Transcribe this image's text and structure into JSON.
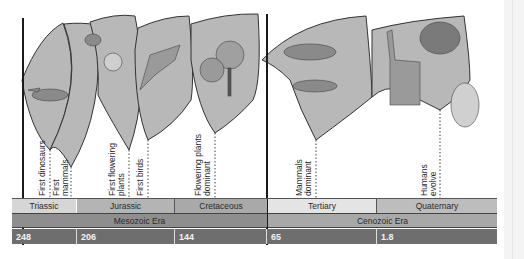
{
  "diagram": {
    "colors": {
      "fan_fill": "#b8b8b8",
      "fan_stroke": "#333333",
      "period_light": "#d6d6d6",
      "period_mid": "#a9a9a9",
      "era_row": "#8e8e8e",
      "era_row_cenozoic": "#a8a8a8",
      "date_row": "#6e6e6e"
    },
    "events": [
      {
        "label_lines": [
          "First dinosaurs"
        ],
        "x": 50
      },
      {
        "label_lines": [
          "First",
          "mammals"
        ],
        "x": 71
      },
      {
        "label_lines": [
          "First flowering",
          "plants"
        ],
        "x": 129
      },
      {
        "label_lines": [
          "First birds"
        ],
        "x": 148
      },
      {
        "label_lines": [
          "Flowering plants",
          "dominant"
        ],
        "x": 215
      },
      {
        "label_lines": [
          "Mammals",
          "dominant"
        ],
        "x": 316
      },
      {
        "label_lines": [
          "Humans",
          "evolve"
        ],
        "x": 440
      }
    ],
    "periods": [
      {
        "name": "Triassic",
        "x": 12,
        "w": 65,
        "shade": "light"
      },
      {
        "name": "Jurassic",
        "x": 77,
        "w": 98,
        "shade": "mid"
      },
      {
        "name": "Cretaceous",
        "x": 175,
        "w": 92,
        "shade": "mid"
      },
      {
        "name": "Tertiary",
        "x": 267,
        "w": 110,
        "shade": "light"
      },
      {
        "name": "Quaternary",
        "x": 377,
        "w": 120,
        "shade": "mid"
      }
    ],
    "eras": [
      {
        "name": "Mesozoic Era",
        "x": 12,
        "w": 255
      },
      {
        "name": "Cenozoic Era",
        "x": 267,
        "w": 230
      }
    ],
    "dates": [
      {
        "value": "248",
        "x": 12,
        "w": 65
      },
      {
        "value": "206",
        "x": 77,
        "w": 98
      },
      {
        "value": "144",
        "x": 175,
        "w": 92
      },
      {
        "value": "65",
        "x": 267,
        "w": 110
      },
      {
        "value": "1.8",
        "x": 377,
        "w": 120
      }
    ],
    "illustrations": [
      "dinosaur-illustration",
      "early-mammal-illustration",
      "flowering-plant-illustration",
      "bird-illustration",
      "trees-illustration",
      "tertiary-mammals-illustration",
      "mammoth-illustration",
      "llama-illustration",
      "human-illustration"
    ]
  }
}
